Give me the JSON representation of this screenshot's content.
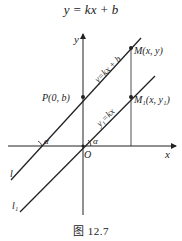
{
  "title": "y = kx + b",
  "caption": "图 12.7",
  "labels": {
    "y_axis": "y",
    "x_axis": "x",
    "origin": "O",
    "point_p": "P(0, b)",
    "point_m": "M(x, y)",
    "point_m1": "M₁(x, y₁)",
    "line_upper_eq": "y=kx + b",
    "line_lower_eq": "y₁=kx",
    "line_l": "l",
    "line_l1": "l₁",
    "angle_upper": "α",
    "angle_lower": "α"
  },
  "colors": {
    "stroke": "#222222",
    "background": "#ffffff"
  }
}
